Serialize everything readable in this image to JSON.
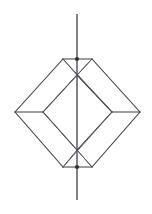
{
  "figure": {
    "background_color": "#ffffff",
    "line_color": "#3a3a44",
    "axis_color": "#2e2e36",
    "canvas": {
      "width": 152,
      "height": 214
    },
    "axis": {
      "name": "vertical-rotation-axis",
      "x": 77,
      "y_top": 14,
      "y_bottom": 200
    },
    "vertices": {
      "apex_top": {
        "x": 77,
        "y": 59
      },
      "apex_bottom": {
        "x": 77,
        "y": 167
      },
      "outer_left": {
        "x": 15,
        "y": 112
      },
      "outer_right": {
        "x": 140,
        "y": 112
      },
      "inner_top": {
        "x": 77,
        "y": 75
      },
      "inner_bottom": {
        "x": 77,
        "y": 150
      },
      "inner_left": {
        "x": 43,
        "y": 112
      },
      "inner_right": {
        "x": 112,
        "y": 112
      },
      "top_edge_left": {
        "x": 63,
        "y": 59
      },
      "top_edge_right": {
        "x": 92,
        "y": 59
      },
      "bottom_edge_left": {
        "x": 63,
        "y": 167
      },
      "bottom_edge_right": {
        "x": 92,
        "y": 167
      }
    },
    "edges": [
      {
        "name": "outer-upper-left",
        "points": "63,59 15,112"
      },
      {
        "name": "outer-upper-right",
        "points": "92,59 140,112"
      },
      {
        "name": "outer-lower-left",
        "points": "15,112 63,167"
      },
      {
        "name": "outer-lower-right",
        "points": "140,112 92,167"
      },
      {
        "name": "apex-top-horizontal",
        "points": "63,59 92,59"
      },
      {
        "name": "apex-bottom-horizontal",
        "points": "63,167 92,167"
      },
      {
        "name": "equator-upper-left",
        "points": "43,112 77,75"
      },
      {
        "name": "equator-upper-right",
        "points": "77,75 112,112"
      },
      {
        "name": "equator-lower-left",
        "points": "43,112 77,150"
      },
      {
        "name": "equator-lower-right",
        "points": "77,150 112,112"
      },
      {
        "name": "strut-left-horizontal",
        "points": "15,112 43,112"
      },
      {
        "name": "strut-right-horizontal",
        "points": "112,112 140,112"
      },
      {
        "name": "apex-top-to-inner-left",
        "points": "63,59 77,75"
      },
      {
        "name": "apex-top-to-inner-right",
        "points": "92,59 77,75"
      },
      {
        "name": "apex-bottom-to-inner-left",
        "points": "63,167 77,150"
      },
      {
        "name": "apex-bottom-to-inner-right",
        "points": "92,167 77,150"
      },
      {
        "name": "diagonal-top-left-down",
        "points": "63,59 112,112"
      },
      {
        "name": "diagonal-top-right-down",
        "points": "92,59 43,112"
      },
      {
        "name": "diagonal-bottom-left-up",
        "points": "63,167 112,112"
      },
      {
        "name": "diagonal-bottom-right-up",
        "points": "92,167 43,112"
      }
    ],
    "vertex_markers": [
      {
        "name": "marker-apex-top",
        "x": 77,
        "y": 59,
        "r": 2.1
      },
      {
        "name": "marker-apex-bottom",
        "x": 77,
        "y": 167,
        "r": 2.1
      }
    ]
  }
}
